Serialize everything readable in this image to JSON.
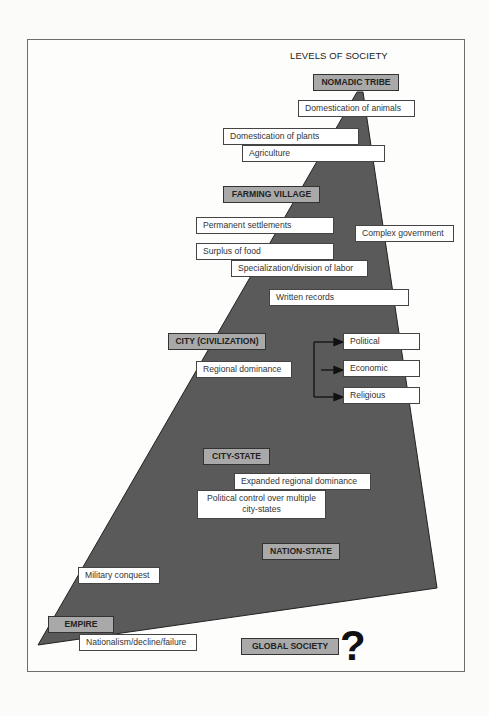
{
  "title": "LEVELS OF SOCIETY",
  "colors": {
    "shape_fill": "#5a5a5a",
    "level_box_fill": "#a9a9a9",
    "note_box_fill": "#ffffff",
    "frame_border": "#6e6e6e"
  },
  "levels": {
    "nomadic_tribe": "NOMADIC TRIBE",
    "farming_village": "FARMING VILLAGE",
    "city_civilization": "CITY (CIVILIZATION)",
    "city_state": "CITY-STATE",
    "nation_state": "NATION-STATE",
    "empire": "EMPIRE",
    "global_society": "GLOBAL SOCIETY"
  },
  "notes": {
    "domestication_animals": "Domestication of animals",
    "domestication_plants": "Domestication of plants",
    "agriculture": "Agriculture",
    "permanent_settlements": "Permanent settlements",
    "complex_government": "Complex government",
    "surplus_food": "Surplus of food",
    "specialization": "Specialization/division of labor",
    "written_records": "Written records",
    "regional_dominance": "Regional dominance",
    "political": "Political",
    "economic": "Economic",
    "religious": "Religious",
    "expanded_regional_dominance": "Expanded regional dominance",
    "political_control": "Political control over multiple city-states",
    "military_conquest": "Military conquest",
    "nationalism": "Nationalism/decline/failure"
  },
  "question_mark": "?"
}
